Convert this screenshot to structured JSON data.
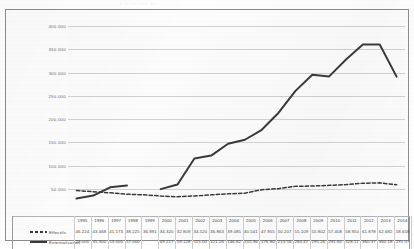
{
  "title_clipped": "· ·  ··   ···  ··",
  "legend": {
    "effectifs_label": "Effectifs",
    "externalisation_label": "Externalisation"
  },
  "axis": {
    "y_ticks": [
      "400.000",
      "350.000",
      "300.000",
      "250.000",
      "200.000",
      "150.000",
      "100.000",
      "50.000"
    ]
  },
  "colors": {
    "line": "#3a3a3a",
    "grid": "#d2d2d2",
    "frame": "#8d8d8d",
    "plot_bg": "#fcfcfc"
  },
  "chart_data": {
    "type": "line",
    "title": "",
    "xlabel": "",
    "ylabel": "",
    "ylim": [
      0,
      400000
    ],
    "grid": true,
    "legend_position": "bottom-left",
    "categories": [
      "1995",
      "1996",
      "1997",
      "1998",
      "1999",
      "2000",
      "2001",
      "2002",
      "2003",
      "2004",
      "2005",
      "2006",
      "2007",
      "2008",
      "2009",
      "2010",
      "2011",
      "2012",
      "2013",
      "2014"
    ],
    "series": [
      {
        "name": "Effectifs",
        "style": "dashed",
        "values": [
          46224,
          43468,
          41173,
          38225,
          36891,
          34320,
          32809,
          34520,
          36863,
          39085,
          40541,
          47955,
          50207,
          55109,
          55802,
          57408,
          58950,
          61878,
          62682,
          58658
        ],
        "labels": [
          "46.224",
          "43.468",
          "41.173",
          "38.225",
          "36.891",
          "34.320",
          "32.809",
          "34.520",
          "36.863",
          "39.085",
          "40.541",
          "47.955",
          "50.207",
          "55.109",
          "55.802",
          "57.408",
          "58.950",
          "61.878",
          "62.682",
          "58.658"
        ]
      },
      {
        "name": "Externalisation",
        "style": "solid",
        "values": [
          29000,
          35300,
          53000,
          57000,
          null,
          49217,
          59128,
          115000,
          121260,
          146820,
          155360,
          176800,
          213560,
          260470,
          295260,
          291600,
          328110,
          360370,
          360180,
          291070
        ],
        "labels": [
          "29.000",
          "35.300",
          "53.000",
          "57.000",
          "",
          "49.217",
          "59.128",
          "115.00",
          "121.26",
          "146.82",
          "155.36",
          "176.80",
          "213.56",
          "260.47",
          "295.26",
          "291.60",
          "328.11",
          "360.37",
          "360.18",
          "291.07"
        ]
      }
    ]
  }
}
